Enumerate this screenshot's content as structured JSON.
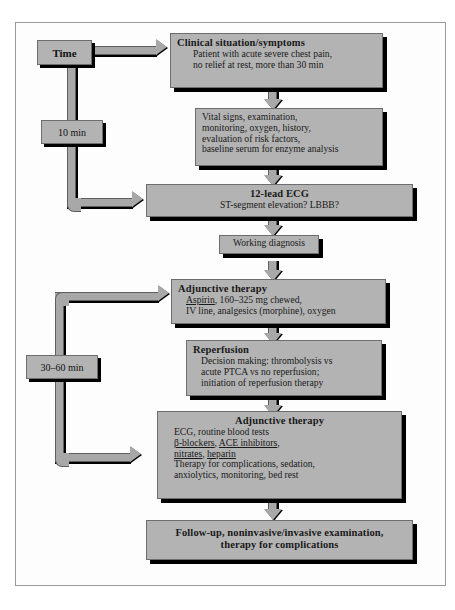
{
  "diagram": {
    "colors": {
      "box_fill": "#b3b3b3",
      "box_border": "#6d6d6d",
      "shadow": "#000000",
      "connector": "#a8a8a8",
      "page_background": "#ffffff",
      "frame_border": "#9a9a9a"
    }
  },
  "time_axis": {
    "label": "Time",
    "markers": [
      {
        "id": "t10",
        "value": "10 min"
      },
      {
        "id": "t3060",
        "value": "30–60 min"
      }
    ]
  },
  "nodes": [
    {
      "id": "clinical",
      "heading": "Clinical situation/symptoms",
      "lines": [
        "Patient with acute severe chest pain,",
        "no relief at rest, more than 30 min"
      ]
    },
    {
      "id": "vitals",
      "heading": "",
      "lines": [
        "Vital signs, examination,",
        "monitoring, oxygen, history,",
        "evaluation of risk factors,",
        "baseline serum for enzyme analysis"
      ]
    },
    {
      "id": "ecg",
      "heading": "12-lead ECG",
      "lines": [
        "ST-segment elevation? LBBB?"
      ]
    },
    {
      "id": "working",
      "heading": "",
      "lines": [
        "Working diagnosis"
      ]
    },
    {
      "id": "adjunctive1",
      "heading": "Adjunctive therapy",
      "lines": [
        "Aspirin, 160–325 mg chewed,",
        "IV line, analgesics (morphine), oxygen"
      ],
      "underlined_terms": [
        "Aspirin"
      ]
    },
    {
      "id": "reperfusion",
      "heading": "Reperfusion",
      "lines": [
        "Decision making: thrombolysis vs",
        "acute PTCA vs no reperfusion;",
        "initiation of reperfusion therapy"
      ]
    },
    {
      "id": "adjunctive2",
      "heading": "Adjunctive therapy",
      "lines": [
        "ECG, routine blood tests",
        "β-blockers, ACE inhibitors,",
        "nitrates, heparin",
        "Therapy for complications, sedation,",
        "anxiolytics, monitoring, bed rest"
      ],
      "underlined_terms": [
        "β-blockers",
        "ACE inhibitors",
        "nitrates",
        "heparin"
      ]
    },
    {
      "id": "followup",
      "heading": "",
      "lines": [
        "Follow-up, noninvasive/invasive examination,",
        "therapy for complications"
      ]
    }
  ],
  "node_text": {
    "clinical_heading": "Clinical situation/symptoms",
    "clinical_l1": "Patient with acute severe chest pain,",
    "clinical_l2": "no relief at rest, more than 30 min",
    "vitals_l1": "Vital signs, examination,",
    "vitals_l2": "monitoring, oxygen, history,",
    "vitals_l3": "evaluation of risk factors,",
    "vitals_l4": "baseline serum for enzyme analysis",
    "ecg_heading": "12-lead ECG",
    "ecg_l1": "ST-segment elevation? LBBB?",
    "working_l1": "Working diagnosis",
    "adj1_heading": "Adjunctive therapy",
    "adj1_l1_u": "Aspirin",
    "adj1_l1_rest": ", 160–325 mg chewed,",
    "adj1_l2": "IV line, analgesics (morphine), oxygen",
    "rep_heading": "Reperfusion",
    "rep_l1": "Decision making: thrombolysis vs",
    "rep_l2": "acute PTCA vs no reperfusion;",
    "rep_l3": "initiation of reperfusion therapy",
    "adj2_heading": "Adjunctive therapy",
    "adj2_l1": "ECG, routine blood tests",
    "adj2_l2_u1": "β-blockers",
    "adj2_l2_mid": ", ",
    "adj2_l2_u2": "ACE inhibitors",
    "adj2_l2_end": ",",
    "adj2_l3_u1": "nitrates",
    "adj2_l3_mid": ", ",
    "adj2_l3_u2": "heparin",
    "adj2_l4": "Therapy for complications, sedation,",
    "adj2_l5": "anxiolytics, monitoring, bed rest",
    "follow_l1": "Follow-up, noninvasive/invasive examination,",
    "follow_l2": "therapy for complications"
  }
}
